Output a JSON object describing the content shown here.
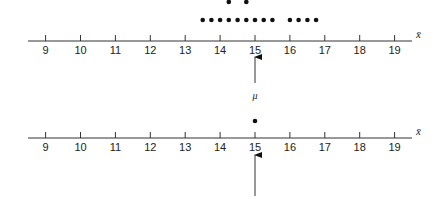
{
  "chart_data": [
    {
      "type": "scatter",
      "title": "",
      "description": "Dot plot of sample means (x-bar) around population mean",
      "xlabel": "x̄",
      "xlim": [
        8.5,
        19.5
      ],
      "ticks": [
        9,
        10,
        11,
        12,
        13,
        14,
        15,
        16,
        17,
        18,
        19
      ],
      "points": [
        {
          "x": 14.25,
          "level": 2
        },
        {
          "x": 14.75,
          "level": 2
        },
        {
          "x": 13.5,
          "level": 1
        },
        {
          "x": 13.75,
          "level": 1
        },
        {
          "x": 14.0,
          "level": 1
        },
        {
          "x": 14.25,
          "level": 1
        },
        {
          "x": 14.5,
          "level": 1
        },
        {
          "x": 14.75,
          "level": 1
        },
        {
          "x": 15.0,
          "level": 1
        },
        {
          "x": 15.25,
          "level": 1
        },
        {
          "x": 15.5,
          "level": 1
        },
        {
          "x": 16.0,
          "level": 1
        },
        {
          "x": 16.25,
          "level": 1
        },
        {
          "x": 16.5,
          "level": 1
        },
        {
          "x": 16.75,
          "level": 1
        }
      ],
      "marker": {
        "x": 15,
        "label": "μ"
      }
    },
    {
      "type": "scatter",
      "title": "",
      "xlabel": "x̄",
      "xlim": [
        8.5,
        19.5
      ],
      "ticks": [
        9,
        10,
        11,
        12,
        13,
        14,
        15,
        16,
        17,
        18,
        19
      ],
      "points": [
        {
          "x": 15,
          "level": 1
        }
      ],
      "marker": {
        "x": 15,
        "label": ""
      }
    }
  ],
  "labels": {
    "axis_var": "x̄",
    "mu": "μ",
    "ticks": [
      "9",
      "10",
      "11",
      "12",
      "13",
      "14",
      "15",
      "16",
      "17",
      "18",
      "19"
    ]
  }
}
